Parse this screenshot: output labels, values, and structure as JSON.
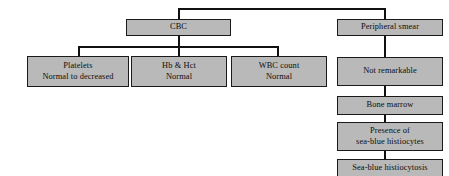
{
  "diagram": {
    "type": "flowchart",
    "style": {
      "node_fill": "#b9b9b9",
      "node_border": "#1a1a1a",
      "edge_color": "#111111",
      "background": "#ffffff"
    },
    "nodes": [
      {
        "id": "cbc",
        "line1": "CBC",
        "line2": ""
      },
      {
        "id": "smear",
        "line1": "Peripheral smear",
        "line2": ""
      },
      {
        "id": "platelets",
        "line1": "Platelets",
        "line2": "Normal to decreased"
      },
      {
        "id": "hbhct",
        "line1": "Hb & Hct",
        "line2": "Normal"
      },
      {
        "id": "wbc",
        "line1": "WBC count",
        "line2": "Normal"
      },
      {
        "id": "notrem",
        "line1": "Not remarkable",
        "line2": ""
      },
      {
        "id": "marrow",
        "line1": "Bone marrow",
        "line2": ""
      },
      {
        "id": "presence",
        "line1": "Presence of",
        "line2": "sea-blue histiocytes"
      },
      {
        "id": "diagnosis",
        "line1": "Sea-blue histiocytosis",
        "line2": ""
      }
    ],
    "edges": [
      {
        "from": "root",
        "to": "cbc"
      },
      {
        "from": "root",
        "to": "smear"
      },
      {
        "from": "cbc",
        "to": "platelets"
      },
      {
        "from": "cbc",
        "to": "hbhct"
      },
      {
        "from": "cbc",
        "to": "wbc"
      },
      {
        "from": "smear",
        "to": "notrem"
      },
      {
        "from": "notrem",
        "to": "marrow"
      },
      {
        "from": "marrow",
        "to": "presence"
      },
      {
        "from": "presence",
        "to": "diagnosis"
      }
    ]
  }
}
